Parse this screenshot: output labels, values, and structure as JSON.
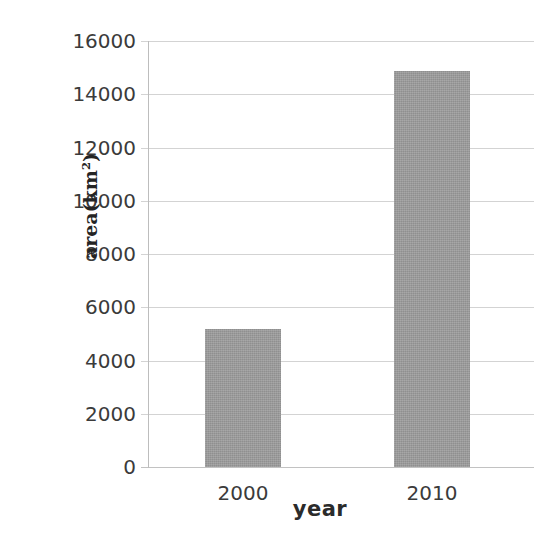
{
  "chart_data": {
    "type": "bar",
    "title": "",
    "xlabel": "year",
    "ylabel": "area(km2)",
    "ylabel_base": "area(km",
    "ylabel_sup": "2",
    "ylabel_tail": ")",
    "categories": [
      "2000",
      "2010"
    ],
    "values": [
      5180,
      14870
    ],
    "series": [
      {
        "name": "area",
        "values": [
          5180,
          14870
        ]
      }
    ],
    "ylim": [
      0,
      16000
    ],
    "y_ticks": [
      0,
      2000,
      4000,
      6000,
      8000,
      10000,
      12000,
      14000,
      16000
    ],
    "y_tick_labels": [
      "0",
      "2000",
      "4000",
      "6000",
      "8000",
      "10000",
      "12000",
      "14000",
      "16000"
    ],
    "x_tick_labels": [
      "2000",
      "2010"
    ],
    "grid": true,
    "grid_axis": "y",
    "legend": false,
    "legend_position": "none",
    "bar_color": "#9d9d9d",
    "gridline_color": "#d3d3d3",
    "axis_line_color": "#bdbdbd",
    "text_color": "#3b3b3b",
    "background_color": "#ffffff"
  }
}
